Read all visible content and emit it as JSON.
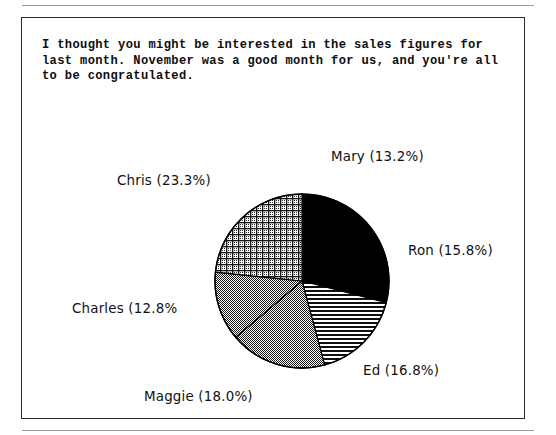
{
  "page": {
    "top_rule": "",
    "bottom_rule": ""
  },
  "caption": {
    "text": "I thought you might be interested in the sales figures for\nlast month. November was a good month for us, and you're all\nto be congratulated."
  },
  "chart_data": {
    "type": "pie",
    "title": "",
    "subtitle": "",
    "xlabel": "",
    "ylabel": "",
    "legend_position": "none",
    "grid": false,
    "start_angle_deg": 0,
    "direction": "clockwise",
    "center": {
      "x": 280,
      "y": 263
    },
    "radius": 87,
    "categories": [
      "Mary",
      "Ron",
      "Ed",
      "Maggie",
      "Charles",
      "Chris"
    ],
    "values": [
      13.2,
      15.8,
      16.8,
      18.0,
      12.8,
      23.3
    ],
    "value_unit": "%",
    "total": 99.9,
    "slices": [
      {
        "name": "Mary",
        "value": 13.2,
        "label": "Mary (13.2%)",
        "fill": "solid-black",
        "fill_color": "#000000",
        "start_deg": 0.0,
        "end_deg": 47.5
      },
      {
        "name": "Ron",
        "value": 15.8,
        "label": "Ron (15.8%)",
        "fill": "solid-black",
        "fill_color": "#000000",
        "start_deg": 47.5,
        "end_deg": 104.4
      },
      {
        "name": "Ed",
        "value": 16.8,
        "label": "Ed (16.8%)",
        "fill": "horizontal-lines",
        "fill_color": "#1a1a1a",
        "start_deg": 104.4,
        "end_deg": 164.9
      },
      {
        "name": "Maggie",
        "value": 18.0,
        "label": "Maggie (18.0%)",
        "fill": "checker-dither",
        "fill_color": "#555555",
        "start_deg": 164.9,
        "end_deg": 229.7
      },
      {
        "name": "Charles",
        "value": 12.8,
        "label": "Charles (12.8%",
        "fill": "checker-dither",
        "fill_color": "#555555",
        "start_deg": 229.7,
        "end_deg": 275.8
      },
      {
        "name": "Chris",
        "value": 23.3,
        "label": "Chris (23.3%)",
        "fill": "crosshatch-grid",
        "fill_color": "#4a4a4a",
        "start_deg": 275.8,
        "end_deg": 360.0
      }
    ],
    "colors": {
      "outline": "#000000",
      "background": "#ffffff",
      "text": "#111111",
      "frame": "#2b2b2b",
      "rule": "#9a9a9a"
    }
  }
}
